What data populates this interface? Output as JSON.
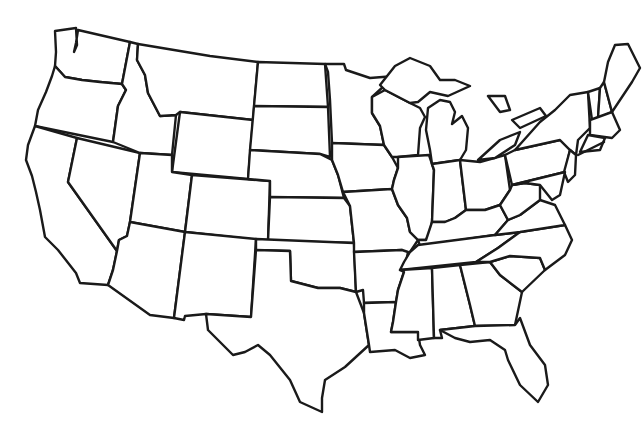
{
  "map": {
    "title": "",
    "type": "outline-map",
    "region": "contiguous-united-states",
    "labels_visible": false,
    "colors": {
      "background": "#ffffff",
      "fill": "#ffffff",
      "stroke": "#1a1a1a"
    }
  }
}
